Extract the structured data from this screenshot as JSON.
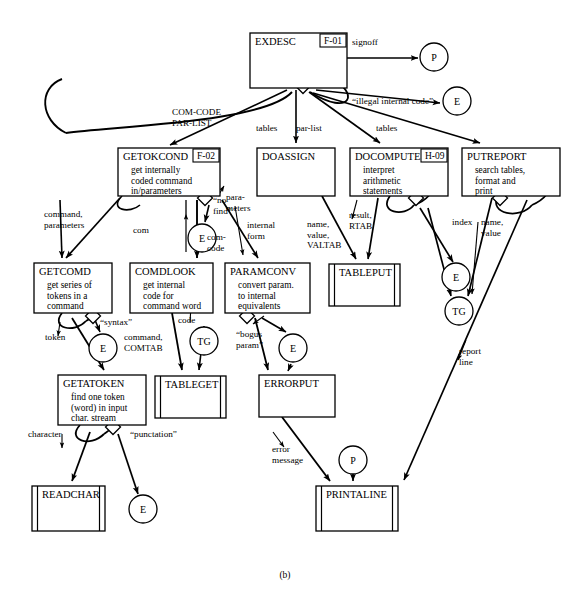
{
  "figure": {
    "caption": "(b)"
  },
  "diagram": {
    "type": "structure-chart",
    "modules": [
      {
        "id": "exdesc",
        "name": "EXDESC",
        "ref": "F-01",
        "desc": [],
        "library": false,
        "x": 250,
        "y": 33,
        "w": 97,
        "h": 55
      },
      {
        "id": "getokcond",
        "name": "GETOKCOND",
        "ref": "F-02",
        "desc": [
          "get internally",
          "coded command",
          "in/parameters"
        ],
        "library": false,
        "x": 118,
        "y": 148,
        "w": 102,
        "h": 48
      },
      {
        "id": "doassign",
        "name": "DOASSIGN",
        "ref": "",
        "desc": [],
        "library": false,
        "x": 257,
        "y": 148,
        "w": 78,
        "h": 48
      },
      {
        "id": "docompute",
        "name": "DOCOMPUTE",
        "ref": "H-09",
        "desc": [
          "interpret",
          "arithmetic",
          "statements"
        ],
        "library": false,
        "x": 350,
        "y": 148,
        "w": 98,
        "h": 48
      },
      {
        "id": "putreport",
        "name": "PUTREPORT",
        "ref": "",
        "desc": [
          "search tables,",
          "format and",
          "print"
        ],
        "library": false,
        "x": 462,
        "y": 148,
        "w": 98,
        "h": 48
      },
      {
        "id": "getcomd",
        "name": "GETCOMD",
        "ref": "",
        "desc": [
          "get series of",
          "tokens in a",
          "command"
        ],
        "library": false,
        "x": 34,
        "y": 263,
        "w": 78,
        "h": 50
      },
      {
        "id": "comdlook",
        "name": "COMDLOOK",
        "ref": "",
        "desc": [
          "get internal",
          "code for",
          "command word"
        ],
        "library": false,
        "x": 130,
        "y": 263,
        "w": 83,
        "h": 50
      },
      {
        "id": "paramconv",
        "name": "PARAMCONV",
        "ref": "",
        "desc": [
          "convert param.",
          "to internal",
          "equivalents"
        ],
        "library": false,
        "x": 225,
        "y": 263,
        "w": 85,
        "h": 50
      },
      {
        "id": "tableput",
        "name": "TABLEPUT",
        "ref": "",
        "desc": [],
        "library": true,
        "x": 329,
        "y": 264,
        "w": 71,
        "h": 42
      },
      {
        "id": "getatoken",
        "name": "GETATOKEN",
        "ref": "",
        "desc": [
          "find one token",
          "(word) in input",
          "char. stream"
        ],
        "library": false,
        "x": 58,
        "y": 375,
        "w": 88,
        "h": 50
      },
      {
        "id": "tableget",
        "name": "TABLEGET",
        "ref": "",
        "desc": [],
        "library": true,
        "x": 155,
        "y": 376,
        "w": 71,
        "h": 42
      },
      {
        "id": "errorput",
        "name": "ERRORPUT",
        "ref": "",
        "desc": [],
        "library": false,
        "x": 259,
        "y": 375,
        "w": 76,
        "h": 42
      },
      {
        "id": "readchar",
        "name": "READCHAR",
        "ref": "",
        "desc": [],
        "library": true,
        "x": 32,
        "y": 486,
        "w": 73,
        "h": 45
      },
      {
        "id": "printaline",
        "name": "PRINTALINE",
        "ref": "",
        "desc": [],
        "library": true,
        "x": 316,
        "y": 486,
        "w": 82,
        "h": 45
      }
    ],
    "connectors": [
      {
        "id": "p-top",
        "label": "P",
        "cx": 434,
        "cy": 57
      },
      {
        "id": "e-top",
        "label": "E",
        "cx": 457,
        "cy": 101
      },
      {
        "id": "e-getok",
        "label": "E",
        "cx": 202,
        "cy": 238
      },
      {
        "id": "e-doc",
        "label": "E",
        "cx": 456,
        "cy": 277
      },
      {
        "id": "tg-put",
        "label": "TG",
        "cx": 459,
        "cy": 311
      },
      {
        "id": "e-getcomd",
        "label": "E",
        "cx": 103,
        "cy": 348
      },
      {
        "id": "tg-mid",
        "label": "TG",
        "cx": 204,
        "cy": 341
      },
      {
        "id": "e-param",
        "label": "E",
        "cx": 293,
        "cy": 348
      },
      {
        "id": "e-getatok",
        "label": "E",
        "cx": 143,
        "cy": 509
      },
      {
        "id": "p-print",
        "label": "P",
        "cx": 353,
        "cy": 460
      }
    ],
    "flows": [
      {
        "id": "signoff",
        "label": "signoff",
        "x": 352,
        "y": 45,
        "lines": [
          "signoff"
        ]
      },
      {
        "id": "illegal-code",
        "label": "“illegal internal code”",
        "x": 352,
        "y": 104,
        "lines": [
          "“illegal internal code”"
        ]
      },
      {
        "id": "comcode-parlist",
        "label": "COM-CODE PAR-LIST",
        "x": 172,
        "y": 115,
        "lines": [
          "COM-CODE",
          "PAR-LIST"
        ]
      },
      {
        "id": "tables-left",
        "label": "tables",
        "x": 256,
        "y": 131,
        "lines": [
          "tables"
        ]
      },
      {
        "id": "par-list",
        "label": "par-list",
        "x": 296,
        "y": 131,
        "lines": [
          "par-list"
        ]
      },
      {
        "id": "tables-right",
        "label": "tables",
        "x": 376,
        "y": 131,
        "lines": [
          "tables"
        ]
      },
      {
        "id": "command-parameters",
        "label": "command, parameters",
        "x": 44,
        "y": 217,
        "lines": [
          "command,",
          "parameters"
        ]
      },
      {
        "id": "no-find",
        "label": "“no find”",
        "x": 213,
        "y": 203,
        "lines": [
          "“no",
          "find”"
        ]
      },
      {
        "id": "com",
        "label": "com",
        "x": 133,
        "y": 233,
        "lines": [
          "com"
        ]
      },
      {
        "id": "com-code",
        "label": "com-code",
        "x": 207,
        "y": 240,
        "lines": [
          "com-",
          "code"
        ]
      },
      {
        "id": "parameters",
        "label": "parameters",
        "x": 226,
        "y": 200,
        "lines": [
          "para-",
          "meters"
        ]
      },
      {
        "id": "internal-form",
        "label": "internal form",
        "x": 247,
        "y": 228,
        "lines": [
          "internal",
          "form"
        ]
      },
      {
        "id": "name-value-valtab",
        "label": "name, value, VALTAB",
        "x": 307,
        "y": 227,
        "lines": [
          "name,",
          "value,",
          "VALTAB"
        ]
      },
      {
        "id": "result-rtab",
        "label": "result, RTAB",
        "x": 349,
        "y": 218,
        "lines": [
          "result,",
          "RTAB"
        ]
      },
      {
        "id": "index",
        "label": "index",
        "x": 452,
        "y": 225,
        "lines": [
          "index"
        ]
      },
      {
        "id": "name-value",
        "label": "name, value",
        "x": 481,
        "y": 225,
        "lines": [
          "name,",
          "value"
        ]
      },
      {
        "id": "syntax",
        "label": "“syntax”",
        "x": 100,
        "y": 325,
        "lines": [
          "“syntax”"
        ]
      },
      {
        "id": "token",
        "label": "token",
        "x": 45,
        "y": 340,
        "lines": [
          "token"
        ]
      },
      {
        "id": "command-comtab",
        "label": "command, COMTAB",
        "x": 124,
        "y": 340,
        "lines": [
          "command,",
          "COMTAB"
        ]
      },
      {
        "id": "code",
        "label": "code",
        "x": 178,
        "y": 323,
        "lines": [
          "code"
        ]
      },
      {
        "id": "bogus-param",
        "label": "“bogus param”",
        "x": 236,
        "y": 337,
        "lines": [
          "“bogus",
          "param”"
        ]
      },
      {
        "id": "character",
        "label": "character",
        "x": 28,
        "y": 437,
        "lines": [
          "character"
        ]
      },
      {
        "id": "punctation",
        "label": "“punctation”",
        "x": 130,
        "y": 437,
        "lines": [
          "“punctation”"
        ]
      },
      {
        "id": "error-message",
        "label": "error message",
        "x": 272,
        "y": 452,
        "lines": [
          "error",
          "message"
        ]
      },
      {
        "id": "report-line",
        "label": "report line",
        "x": 459,
        "y": 354,
        "lines": [
          "report",
          "line"
        ]
      }
    ]
  }
}
